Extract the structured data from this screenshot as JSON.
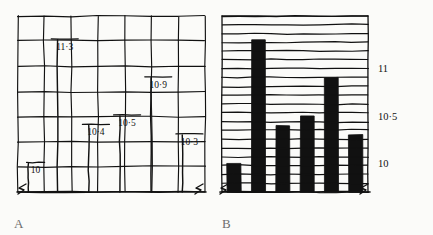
{
  "figure": {
    "background_color": "#fbfbf9",
    "ink_color": "#111111",
    "bar_fill_a": "#ffffff",
    "bar_fill_b": "#111111"
  },
  "panels": [
    {
      "letter": "A",
      "name": "panel-a-gridded-outline-bars",
      "style": "outline bars over full vertical and horizontal grid, value labels on bar tops"
    },
    {
      "letter": "B",
      "name": "panel-b-solid-bars-horizontal-rules",
      "style": "solid black bars over dense horizontal rules, value axis on right"
    }
  ],
  "axis": {
    "tick_labels": [
      "11",
      "10·5",
      "10"
    ],
    "tick_values": [
      11,
      10.5,
      10
    ],
    "break_symbol": "axis-break-zigzag"
  },
  "chart_data": {
    "type": "bar",
    "title": "",
    "subtitle": "",
    "xlabel": "",
    "ylabel": "",
    "categories": [
      "1",
      "2",
      "3",
      "4",
      "5",
      "6"
    ],
    "values": [
      10,
      11.3,
      10.4,
      10.5,
      10.9,
      10.3
    ],
    "value_labels": [
      "10",
      "11·3",
      "10·4",
      "10·5",
      "10·9",
      "10·3"
    ],
    "ylim": [
      9.7,
      11.55
    ],
    "yticks": [
      10,
      10.5,
      11
    ],
    "ytick_labels": [
      "10",
      "10·5",
      "11"
    ],
    "grid": true,
    "legend": null,
    "axis_break": true,
    "panel_a": {
      "grid": "both",
      "grid_columns": 7,
      "grid_rows": 7,
      "bar_style": "white fill, black outline",
      "labels_on_bars": true
    },
    "panel_b": {
      "grid": "horizontal",
      "grid_rows": 20,
      "bar_style": "solid black fill",
      "labels_on_bars": false,
      "axis_labels_side": "right"
    }
  }
}
